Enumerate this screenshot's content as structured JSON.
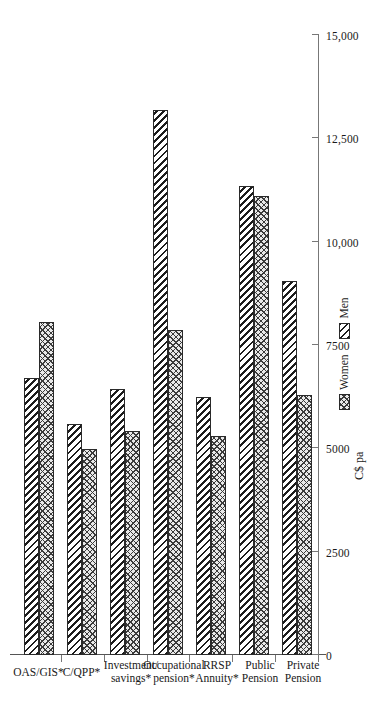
{
  "chart_data": {
    "type": "bar",
    "orientation": "horizontal-rotated",
    "title": "",
    "xlabel": "",
    "ylabel": "C$ pa",
    "axis_title": "C$ pa",
    "categories": [
      "OAS/GIS*",
      "C/QPP*",
      "Investment/\nsavings*",
      "Occupational\npension*",
      "RRSP\nAnnuity*",
      "Public\nPension",
      "Private\nPension"
    ],
    "series": [
      {
        "name": "Women",
        "pattern": "cross-hatch",
        "values": [
          8050,
          4980,
          5420,
          7870,
          5290,
          11110,
          6300
        ]
      },
      {
        "name": "Men",
        "pattern": "diagonal-hatch",
        "values": [
          6710,
          5580,
          6440,
          13190,
          6250,
          11340,
          9040
        ]
      }
    ],
    "ylim": [
      0,
      15000
    ],
    "ticks": [
      0,
      2500,
      5000,
      7500,
      10000,
      12500,
      15000
    ],
    "tick_labels": [
      "0",
      "2500",
      "5000",
      "7500",
      "10,000",
      "12,500",
      "15,000"
    ],
    "grid": false,
    "legend_position": "bottom-right",
    "legend": [
      "Women",
      "Men"
    ]
  }
}
